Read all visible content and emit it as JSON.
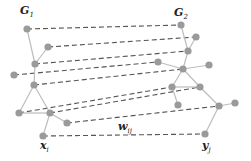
{
  "diagram": {
    "colors": {
      "node": "#9a9a9a",
      "edge": "#bdbdbd",
      "match": "#555555",
      "label": "#222222"
    },
    "labels": {
      "g1": {
        "base": "G",
        "sub": "1",
        "x": 20,
        "y": 5
      },
      "g2": {
        "base": "G",
        "sub": "2",
        "x": 174,
        "y": 7
      },
      "xi": {
        "base": "x",
        "sub": "i",
        "x": 40,
        "y": 140
      },
      "yj": {
        "base": "y",
        "sub": "j",
        "x": 202,
        "y": 140
      },
      "wij": {
        "base": "w",
        "sub": "ij",
        "x": 118,
        "y": 121
      }
    },
    "graph1": {
      "name": "G1",
      "nodes": [
        {
          "id": "n1",
          "x": 27,
          "y": 29
        },
        {
          "id": "n2",
          "x": 48,
          "y": 47
        },
        {
          "id": "n3",
          "x": 35,
          "y": 64
        },
        {
          "id": "n4",
          "x": 14,
          "y": 75
        },
        {
          "id": "n5",
          "x": 34,
          "y": 85
        },
        {
          "id": "n6",
          "x": 19,
          "y": 113
        },
        {
          "id": "n7",
          "x": 50,
          "y": 113
        },
        {
          "id": "n8",
          "x": 67,
          "y": 123
        },
        {
          "id": "n9",
          "x": 43,
          "y": 136
        }
      ],
      "edges": [
        [
          "n1",
          "n3"
        ],
        [
          "n2",
          "n3"
        ],
        [
          "n3",
          "n5"
        ],
        [
          "n5",
          "n6"
        ],
        [
          "n5",
          "n7"
        ],
        [
          "n6",
          "n7"
        ],
        [
          "n7",
          "n8"
        ],
        [
          "n7",
          "n9"
        ]
      ]
    },
    "graph2": {
      "name": "G2",
      "nodes": [
        {
          "id": "m1",
          "x": 181,
          "y": 25
        },
        {
          "id": "m2",
          "x": 196,
          "y": 37
        },
        {
          "id": "m3",
          "x": 188,
          "y": 51
        },
        {
          "id": "m4",
          "x": 158,
          "y": 62
        },
        {
          "id": "m5",
          "x": 183,
          "y": 69
        },
        {
          "id": "m6",
          "x": 209,
          "y": 65
        },
        {
          "id": "m7",
          "x": 172,
          "y": 87
        },
        {
          "id": "m8",
          "x": 200,
          "y": 87
        },
        {
          "id": "m9",
          "x": 178,
          "y": 105
        },
        {
          "id": "m10",
          "x": 219,
          "y": 106
        },
        {
          "id": "m11",
          "x": 235,
          "y": 103
        },
        {
          "id": "m12",
          "x": 205,
          "y": 134
        }
      ],
      "edges": [
        [
          "m1",
          "m3"
        ],
        [
          "m2",
          "m3"
        ],
        [
          "m3",
          "m5"
        ],
        [
          "m4",
          "m5"
        ],
        [
          "m5",
          "m6"
        ],
        [
          "m5",
          "m7"
        ],
        [
          "m5",
          "m8"
        ],
        [
          "m7",
          "m8"
        ],
        [
          "m7",
          "m9"
        ],
        [
          "m8",
          "m10"
        ],
        [
          "m10",
          "m11"
        ],
        [
          "m10",
          "m12"
        ]
      ]
    },
    "matches": [
      [
        "n1",
        "m1"
      ],
      [
        "n2",
        "m2"
      ],
      [
        "n3",
        "m3"
      ],
      [
        "n4",
        "m4"
      ],
      [
        "n5",
        "m5"
      ],
      [
        "n6",
        "m7"
      ],
      [
        "n7",
        "m8"
      ],
      [
        "n8",
        "m10"
      ],
      [
        "n9",
        "m12"
      ]
    ]
  }
}
